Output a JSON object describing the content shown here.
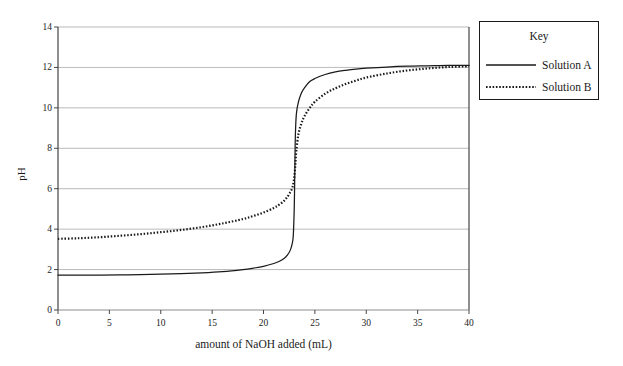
{
  "chart_data": {
    "type": "line",
    "title": "",
    "xlabel": "amount of NaOH added (mL)",
    "ylabel": "pH",
    "xlim": [
      0,
      40
    ],
    "ylim": [
      0,
      14
    ],
    "xticks": [
      0,
      5,
      10,
      15,
      20,
      25,
      30,
      35,
      40
    ],
    "yticks": [
      0,
      2,
      4,
      6,
      8,
      10,
      12,
      14
    ],
    "grid": "horizontal",
    "legend_position": "right-outside",
    "legend_title": "Key",
    "series": [
      {
        "name": "Solution A",
        "style": "solid",
        "color": "#1a1a1a",
        "x": [
          0,
          2,
          4,
          6,
          8,
          10,
          12,
          14,
          16,
          18,
          19,
          20,
          21,
          21.5,
          22,
          22.3,
          22.6,
          22.8,
          22.9,
          23,
          23.05,
          23.1,
          23.2,
          23.4,
          23.7,
          24,
          24.5,
          25,
          26,
          27,
          28,
          29,
          30,
          32,
          34,
          36,
          38,
          40
        ],
        "y": [
          1.72,
          1.72,
          1.73,
          1.74,
          1.75,
          1.77,
          1.8,
          1.84,
          1.9,
          2.0,
          2.07,
          2.16,
          2.3,
          2.4,
          2.55,
          2.7,
          2.95,
          3.3,
          3.7,
          5.2,
          7.0,
          8.6,
          9.7,
          10.3,
          10.75,
          11.0,
          11.3,
          11.45,
          11.65,
          11.78,
          11.86,
          11.92,
          11.96,
          12.02,
          12.06,
          12.08,
          12.1,
          12.1
        ]
      },
      {
        "name": "Solution B",
        "style": "dotted",
        "color": "#1a1a1a",
        "x": [
          0,
          2,
          4,
          6,
          8,
          10,
          12,
          14,
          16,
          18,
          19,
          20,
          21,
          21.5,
          22,
          22.3,
          22.6,
          22.8,
          22.9,
          23,
          23.1,
          23.2,
          23.4,
          23.7,
          24,
          24.5,
          25,
          26,
          27,
          28,
          29,
          30,
          32,
          34,
          36,
          38,
          40
        ],
        "y": [
          3.52,
          3.55,
          3.6,
          3.67,
          3.75,
          3.85,
          3.96,
          4.1,
          4.28,
          4.5,
          4.65,
          4.82,
          5.05,
          5.2,
          5.4,
          5.58,
          5.82,
          6.05,
          6.25,
          6.6,
          7.2,
          7.9,
          8.7,
          9.25,
          9.6,
          10.0,
          10.3,
          10.7,
          10.97,
          11.18,
          11.35,
          11.5,
          11.7,
          11.85,
          11.95,
          12.02,
          12.06
        ]
      }
    ]
  },
  "axes": {
    "y_title": "pH",
    "x_title": "amount of NaOH added (mL)"
  },
  "legend": {
    "title": "Key",
    "items": [
      {
        "label": "Solution A",
        "style": "solid"
      },
      {
        "label": "Solution B",
        "style": "dotted"
      }
    ]
  },
  "geometry": {
    "plot_left": 58,
    "plot_right": 469,
    "plot_top": 27,
    "plot_bottom": 310
  },
  "colors": {
    "ink": "#1a1a1a",
    "grid": "#a8a8a8",
    "axis": "#4a4a4a",
    "background": "#ffffff"
  }
}
